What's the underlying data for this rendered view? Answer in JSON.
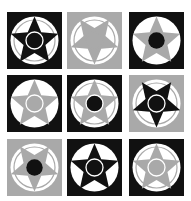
{
  "colors": {
    "black": "#111111",
    "gray": "#a9a9a9",
    "white": "#ffffff"
  },
  "cells": [
    {
      "bg": "black",
      "star": "black",
      "orientation": "up",
      "ring": "white",
      "center": "black",
      "outer_ring": "gray"
    },
    {
      "bg": "gray",
      "star": "gray",
      "orientation": "down",
      "ring": "gray",
      "center": "gray",
      "outer_ring": "gray"
    },
    {
      "bg": "black",
      "star": "gray",
      "orientation": "up",
      "ring": "none",
      "center": "black",
      "outer_ring": "none"
    },
    {
      "bg": "black",
      "star": "gray",
      "orientation": "up",
      "ring": "white",
      "center": "gray",
      "outer_ring": "none"
    },
    {
      "bg": "black",
      "star": "gray",
      "orientation": "up",
      "ring": "white",
      "center": "black",
      "outer_ring": "gray"
    },
    {
      "bg": "gray",
      "star": "black",
      "orientation": "down",
      "ring": "white",
      "center": "black",
      "outer_ring": "gray"
    },
    {
      "bg": "gray",
      "star": "gray",
      "orientation": "down",
      "ring": "none",
      "center": "black",
      "outer_ring": "gray"
    },
    {
      "bg": "black",
      "star": "black",
      "orientation": "up",
      "ring": "white",
      "center": "black",
      "outer_ring": "none"
    },
    {
      "bg": "black",
      "star": "gray",
      "orientation": "up",
      "ring": "white",
      "center": "gray",
      "outer_ring": "gray"
    }
  ]
}
